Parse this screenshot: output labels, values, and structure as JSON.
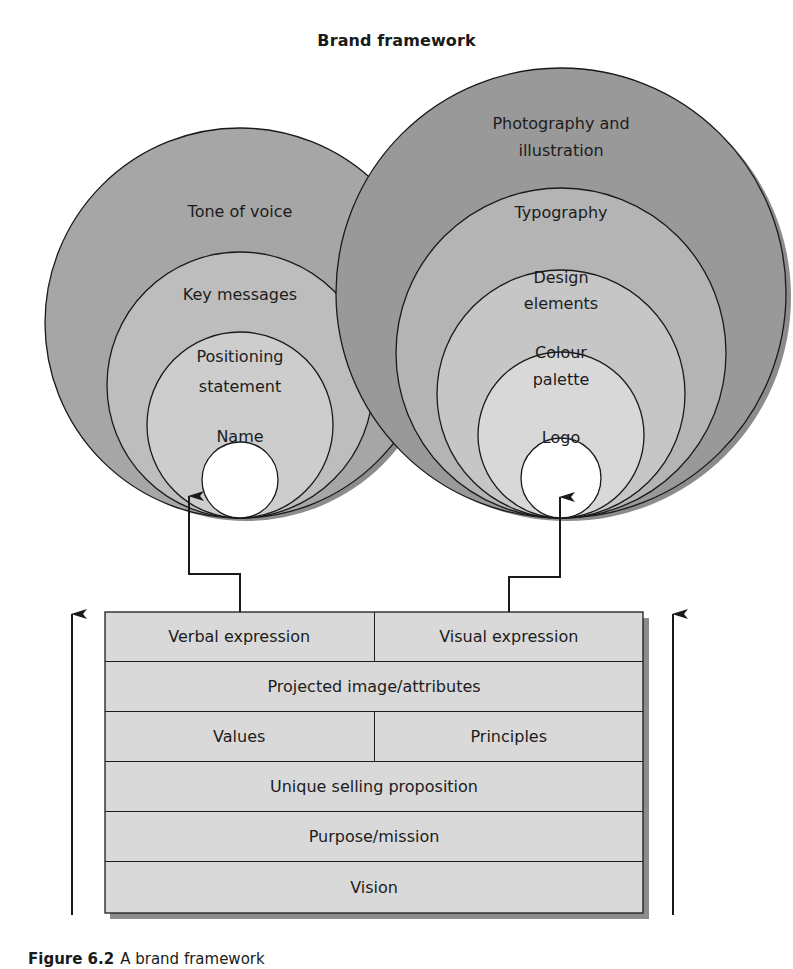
{
  "title": "Brand framework",
  "caption": {
    "figure_number": "Figure 6.2",
    "text": "A brand framework"
  },
  "colors": {
    "outer_dark": "#9a9a9a",
    "mid": "#b4b4b4",
    "light": "#cfcfcf",
    "lighter": "#dedede",
    "center": "#ffffff",
    "box_fill": "#d9d9d9",
    "shadow": "#8c8c8c",
    "stroke": "#1a1a1a"
  },
  "verbal_circles": {
    "rings": [
      {
        "label_lines": [
          "Tone of voice"
        ]
      },
      {
        "label_lines": [
          "Key messages"
        ]
      },
      {
        "label_lines": [
          "Positioning",
          "statement"
        ]
      },
      {
        "label_lines": [
          "Name"
        ]
      }
    ]
  },
  "visual_circles": {
    "rings": [
      {
        "label_lines": [
          "Photography and",
          "illustration"
        ]
      },
      {
        "label_lines": [
          "Typography"
        ]
      },
      {
        "label_lines": [
          "Design",
          "elements"
        ]
      },
      {
        "label_lines": [
          "Colour",
          "palette"
        ]
      },
      {
        "label_lines": [
          "Logo"
        ]
      }
    ]
  },
  "stack": {
    "rows": [
      {
        "cells": [
          "Verbal expression",
          "Visual expression"
        ]
      },
      {
        "cells": [
          "Projected image/attributes"
        ]
      },
      {
        "cells": [
          "Values",
          "Principles"
        ]
      },
      {
        "cells": [
          "Unique selling proposition"
        ]
      },
      {
        "cells": [
          "Purpose/mission"
        ]
      },
      {
        "cells": [
          "Vision"
        ]
      }
    ]
  }
}
